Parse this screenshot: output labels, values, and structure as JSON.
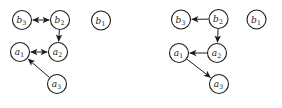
{
  "figure": {
    "background": "#ffffff",
    "ink": "#1c1c1c",
    "node_radius": 9.5,
    "canvas": {
      "width": 282,
      "height": 108
    },
    "graphs": [
      {
        "name": "left-graph",
        "nodes": [
          {
            "id": "b3",
            "label": "b",
            "sub": "3",
            "x": 22,
            "y": 20
          },
          {
            "id": "b2",
            "label": "b",
            "sub": "2",
            "x": 60,
            "y": 20
          },
          {
            "id": "b1",
            "label": "b",
            "sub": "1",
            "x": 101,
            "y": 20.5
          },
          {
            "id": "a1",
            "label": "a",
            "sub": "1",
            "x": 20,
            "y": 52
          },
          {
            "id": "a2",
            "label": "a",
            "sub": "2",
            "x": 58,
            "y": 52
          },
          {
            "id": "a3",
            "label": "a",
            "sub": "3",
            "x": 57,
            "y": 84
          }
        ],
        "edges": [
          {
            "from": "b2",
            "to": "b3",
            "type": "bidirected"
          },
          {
            "from": "b2",
            "to": "a2",
            "type": "directed"
          },
          {
            "from": "a2",
            "to": "a1",
            "type": "bidirected"
          },
          {
            "from": "a3",
            "to": "a1",
            "type": "directed"
          }
        ]
      },
      {
        "name": "right-graph",
        "nodes": [
          {
            "id": "b3",
            "label": "b",
            "sub": "3",
            "x": 181,
            "y": 19.5
          },
          {
            "id": "b2",
            "label": "b",
            "sub": "2",
            "x": 218.5,
            "y": 19
          },
          {
            "id": "b1",
            "label": "b",
            "sub": "1",
            "x": 256.5,
            "y": 19.5
          },
          {
            "id": "a1",
            "label": "a",
            "sub": "1",
            "x": 179,
            "y": 53
          },
          {
            "id": "a2",
            "label": "a",
            "sub": "2",
            "x": 217,
            "y": 53
          },
          {
            "id": "a3",
            "label": "a",
            "sub": "3",
            "x": 219,
            "y": 84
          }
        ],
        "edges": [
          {
            "from": "b2",
            "to": "b3",
            "type": "directed"
          },
          {
            "from": "b2",
            "to": "a2",
            "type": "directed"
          },
          {
            "from": "a2",
            "to": "a1",
            "type": "directed"
          },
          {
            "from": "a1",
            "to": "a3",
            "type": "directed"
          }
        ]
      }
    ]
  }
}
